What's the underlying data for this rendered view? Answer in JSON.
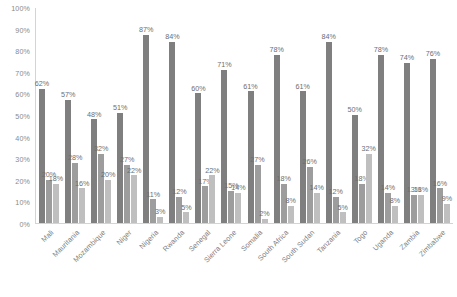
{
  "chart_data": {
    "type": "bar",
    "title": "",
    "xlabel": "",
    "ylabel": "",
    "ylim": [
      0,
      100
    ],
    "grid": false,
    "legend": "none",
    "value_suffix": "%",
    "y_ticks": [
      "100%",
      "90%",
      "80%",
      "70%",
      "60%",
      "50%",
      "40%",
      "30%",
      "20%",
      "10%",
      "0%"
    ],
    "y_tick_values": [
      100,
      90,
      80,
      70,
      60,
      50,
      40,
      30,
      20,
      10,
      0
    ],
    "categories": [
      "Mali",
      "Mauritania",
      "Mozambique",
      "Niger",
      "Nigeria",
      "Rwanda",
      "Senegal",
      "Sierra Leone",
      "Somalia",
      "South Africa",
      "South Sudan",
      "Tanzania",
      "Togo",
      "Uganda",
      "Zambia",
      "Zimbabwe"
    ],
    "series": [
      {
        "name": "Series 1",
        "color": "#7f7f7f",
        "values": [
          62,
          57,
          48,
          51,
          87,
          84,
          60,
          71,
          61,
          78,
          61,
          84,
          50,
          78,
          74,
          76
        ],
        "labels": [
          "62%",
          "57%",
          "48%",
          "51%",
          "87%",
          "84%",
          "60%",
          "71%",
          "61%",
          "78%",
          "61%",
          "84%",
          "50%",
          "78%",
          "74%",
          "76%"
        ]
      },
      {
        "name": "Series 2",
        "color": "#9d9d9d",
        "values": [
          20,
          28,
          32,
          27,
          11,
          12,
          17,
          15,
          27,
          18,
          26,
          12,
          18,
          14,
          13,
          16
        ],
        "labels": [
          "20%",
          "28%",
          "32%",
          "27%",
          "11%",
          "12%",
          "17%",
          "15%",
          "27%",
          "18%",
          "26%",
          "12%",
          "18%",
          "14%",
          "13%",
          "16%"
        ]
      },
      {
        "name": "Series 3",
        "color": "#bfbfbf",
        "values": [
          18,
          16,
          20,
          22,
          3,
          5,
          22,
          14,
          2,
          8,
          14,
          5,
          32,
          8,
          13,
          9
        ],
        "labels": [
          "18%",
          "16%",
          "20%",
          "22%",
          "3%",
          "5%",
          "22%",
          "14%",
          "2%",
          "8%",
          "14%",
          "5%",
          "32%",
          "8%",
          "13%",
          "9%"
        ]
      }
    ]
  }
}
